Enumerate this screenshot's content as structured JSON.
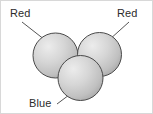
{
  "figure": {
    "canvas": {
      "width": 153,
      "height": 114,
      "background": "#ffffff"
    },
    "border": {
      "visible": true,
      "color": "#d8d8d8",
      "width": 1
    },
    "style": {
      "sphere_outline": "#4a4a4a",
      "sphere_fill_light": "#e8e8e8",
      "sphere_fill_mid": "#c9c9c9",
      "sphere_fill_dark": "#a8a8a8",
      "leader_line": "#555555",
      "label_color": "#2b2b2b"
    },
    "spheres": [
      {
        "id": "sphere-top-left",
        "label": "Red",
        "cx": 55.5,
        "cy": 55.5,
        "r": 22.5
      },
      {
        "id": "sphere-top-right",
        "label": "Red",
        "cx": 99.5,
        "cy": 54.5,
        "r": 22.0
      },
      {
        "id": "sphere-bottom",
        "label": "Blue",
        "cx": 80.5,
        "cy": 78.0,
        "r": 22.5
      }
    ],
    "leader_lines": [
      {
        "id": "leader-red-left",
        "x1": 22,
        "y1": 22,
        "x2": 45,
        "y2": 40
      },
      {
        "id": "leader-red-right",
        "x1": 129,
        "y1": 22,
        "x2": 109,
        "y2": 40
      },
      {
        "id": "leader-blue",
        "x1": 57,
        "y1": 104,
        "x2": 73,
        "y2": 92
      }
    ],
    "labels": {
      "red_left": "Red",
      "red_right": "Red",
      "blue": "Blue"
    }
  }
}
